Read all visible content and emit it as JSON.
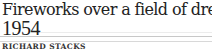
{
  "article": {
    "title": "Fireworks over a field of dreams",
    "year": "1954",
    "author": "RICHARD STACKS"
  }
}
